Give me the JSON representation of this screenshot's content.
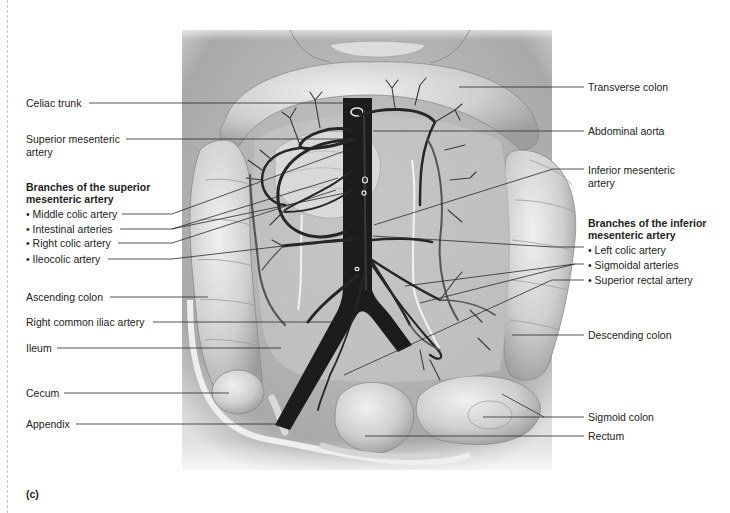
{
  "figure": {
    "panel_letter": "(c)"
  },
  "left_labels": {
    "celiac_trunk": "Celiac trunk",
    "superior_mesenteric_line1": "Superior mesenteric",
    "superior_mesenteric_line2": "artery",
    "sma_branches_heading_line1": "Branches of the superior",
    "sma_branches_heading_line2": "mesenteric artery",
    "sma_branches": [
      "Middle colic artery",
      "Intestinal arteries",
      "Right colic artery",
      "Ileocolic artery"
    ],
    "ascending_colon": "Ascending colon",
    "right_common_iliac": "Right common iliac artery",
    "ileum": "Ileum",
    "cecum": "Cecum",
    "appendix": "Appendix"
  },
  "right_labels": {
    "transverse_colon": "Transverse colon",
    "abdominal_aorta": "Abdominal aorta",
    "inferior_mesenteric_line1": "Inferior mesenteric",
    "inferior_mesenteric_line2": "artery",
    "ima_branches_heading_line1": "Branches of the inferior",
    "ima_branches_heading_line2": "mesenteric artery",
    "ima_branches": [
      "Left colic artery",
      "Sigmoidal arteries",
      "Superior rectal artery"
    ],
    "descending_colon": "Descending colon",
    "sigmoid_colon": "Sigmoid colon",
    "rectum": "Rectum"
  },
  "colors": {
    "artery": "#1c1c1c",
    "artery_secondary": "#4a4a4a",
    "colon_fill": "#d2d2d2",
    "colon_highlight": "#ececec",
    "body_fill": "#b9b9b9",
    "mesentery": "#f4f4f4",
    "leader_line": "#2a2a2a"
  }
}
